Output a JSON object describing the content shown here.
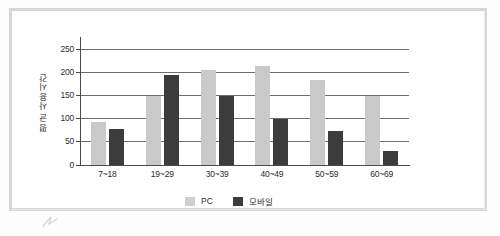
{
  "chart_data": {
    "type": "bar",
    "title": "",
    "xlabel": "",
    "ylabel": "평균 사용시간",
    "categories": [
      "7~18",
      "19~29",
      "30~39",
      "40~49",
      "50~59",
      "60~69"
    ],
    "series": [
      {
        "name": "PC",
        "color": "#c9c9c9",
        "values": [
          92,
          148,
          205,
          213,
          183,
          149
        ]
      },
      {
        "name": "모바일",
        "color": "#3c3c3c",
        "values": [
          77,
          193,
          149,
          100,
          73,
          30
        ]
      }
    ],
    "ylim": [
      0,
      260
    ],
    "yticks": [
      0,
      50,
      100,
      150,
      200,
      250
    ],
    "ytick_labels": [
      "0",
      "50",
      "100",
      "150",
      "200",
      "250"
    ],
    "grid": true,
    "legend_position": "bottom"
  },
  "legend": {
    "items": [
      {
        "label": "PC",
        "swatch": "pc"
      },
      {
        "label": "모바일",
        "swatch": "mobile"
      }
    ]
  }
}
